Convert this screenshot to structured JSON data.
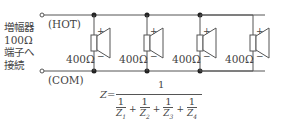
{
  "amplifier_label": [
    "増幅器",
    "100Ω",
    "端子へ",
    "接続"
  ],
  "terminals": {
    "hot": "(HOT)",
    "com": "(COM)"
  },
  "speakers": [
    {
      "impedance": "400Ω",
      "plus": "+",
      "minus": "−"
    },
    {
      "impedance": "400Ω",
      "plus": "+",
      "minus": "−"
    },
    {
      "impedance": "400Ω",
      "plus": "+",
      "minus": "−"
    },
    {
      "impedance": "400Ω",
      "plus": "+",
      "minus": "−"
    }
  ],
  "formula": {
    "lhs": "Z=",
    "numerator": "1",
    "terms": [
      "Z1",
      "Z2",
      "Z3",
      "Z4"
    ],
    "term_num": "1",
    "op": "+"
  }
}
